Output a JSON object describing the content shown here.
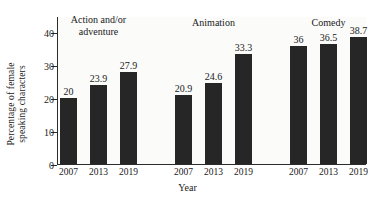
{
  "chart_data": {
    "type": "bar",
    "title": "",
    "xlabel": "Year",
    "ylabel_line1": "Percentage of female",
    "ylabel_line2": "speaking characters",
    "ylim": [
      0,
      45
    ],
    "yticks": [
      0,
      10,
      20,
      30,
      40
    ],
    "ytick_labels": [
      "0",
      "10",
      "20",
      "30",
      "40"
    ],
    "grid": false,
    "legend": "none",
    "categories": [
      "2007",
      "2013",
      "2019"
    ],
    "groups": [
      {
        "name": "Action and/or\nadventure",
        "name_line1": "Action and/or",
        "name_line2": "adventure",
        "bars": [
          {
            "x": "2007",
            "value": 20,
            "label": "20"
          },
          {
            "x": "2013",
            "value": 23.9,
            "label": "23.9"
          },
          {
            "x": "2019",
            "value": 27.9,
            "label": "27.9"
          }
        ]
      },
      {
        "name": "Animation",
        "name_line1": "Animation",
        "name_line2": "",
        "bars": [
          {
            "x": "2007",
            "value": 20.9,
            "label": "20.9"
          },
          {
            "x": "2013",
            "value": 24.6,
            "label": "24.6"
          },
          {
            "x": "2019",
            "value": 33.3,
            "label": "33.3"
          }
        ]
      },
      {
        "name": "Comedy",
        "name_line1": "Comedy",
        "name_line2": "",
        "bars": [
          {
            "x": "2007",
            "value": 36,
            "label": "36"
          },
          {
            "x": "2013",
            "value": 36.5,
            "label": "36.5"
          },
          {
            "x": "2019",
            "value": 38.7,
            "label": "38.7"
          }
        ]
      }
    ],
    "bar_color": "#262626",
    "plot_background": "#fbfbfa",
    "axis_color": "#2b2b2b"
  }
}
